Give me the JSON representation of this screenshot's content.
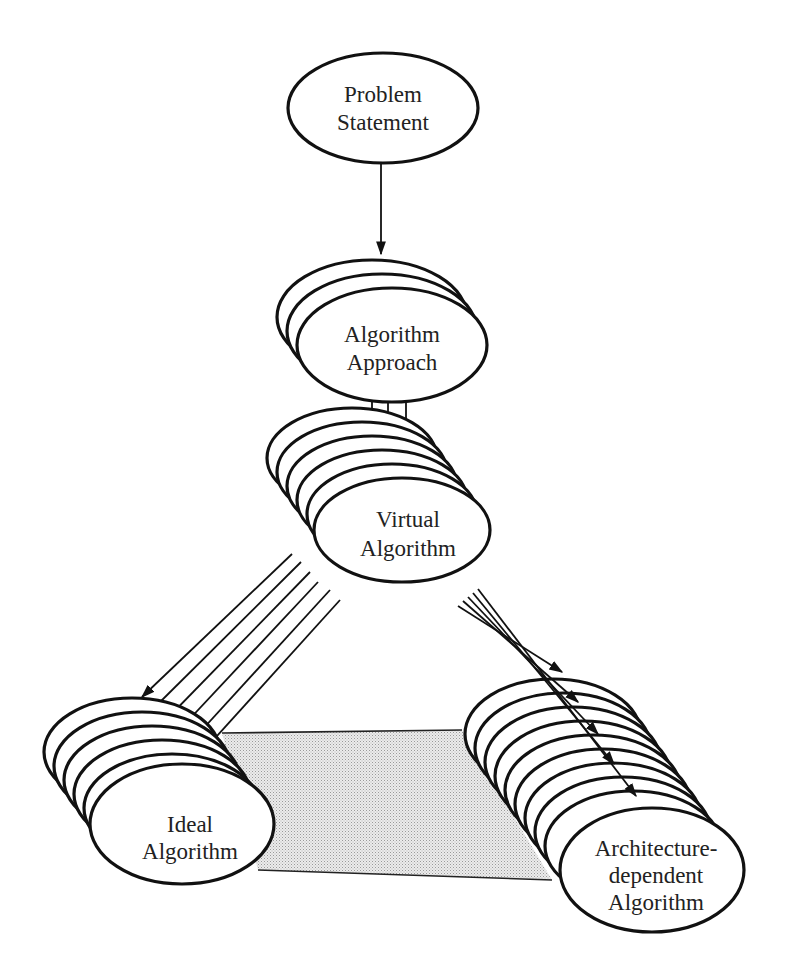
{
  "diagram": {
    "type": "hierarchical process flow with stacked (multiplicity) ellipses",
    "nodes": [
      {
        "id": "problem",
        "lines": [
          "Problem",
          "Statement"
        ],
        "stack_count": 1
      },
      {
        "id": "approach",
        "lines": [
          "Algorithm",
          "Approach"
        ],
        "stack_count": 3
      },
      {
        "id": "virtual",
        "lines": [
          "Virtual",
          "Algorithm"
        ],
        "stack_count": 6
      },
      {
        "id": "ideal",
        "lines": [
          "Ideal",
          "Algorithm"
        ],
        "stack_count": 6
      },
      {
        "id": "archdep",
        "lines": [
          "Architecture-",
          "dependent",
          "Algorithm"
        ],
        "stack_count": 10
      }
    ],
    "edges": [
      {
        "from": "problem",
        "to": "approach",
        "count": 1
      },
      {
        "from": "approach",
        "to": "virtual",
        "count": 3
      },
      {
        "from": "virtual",
        "to": "ideal",
        "count": 6
      },
      {
        "from": "virtual",
        "to": "archdep",
        "count": 5
      }
    ],
    "relation": {
      "between": [
        "ideal",
        "archdep"
      ],
      "style": "shaded quadrilateral"
    },
    "colors": {
      "stroke": "#111111",
      "background": "#ffffff",
      "shade": "#d9d9d9"
    }
  },
  "labels": {
    "problem": {
      "l1": "Problem",
      "l2": "Statement"
    },
    "approach": {
      "l1": "Algorithm",
      "l2": "Approach"
    },
    "virtual": {
      "l1": "Virtual",
      "l2": "Algorithm"
    },
    "ideal": {
      "l1": "Ideal",
      "l2": "Algorithm"
    },
    "archdep": {
      "l1": "Architecture-",
      "l2": "dependent",
      "l3": "Algorithm"
    }
  }
}
